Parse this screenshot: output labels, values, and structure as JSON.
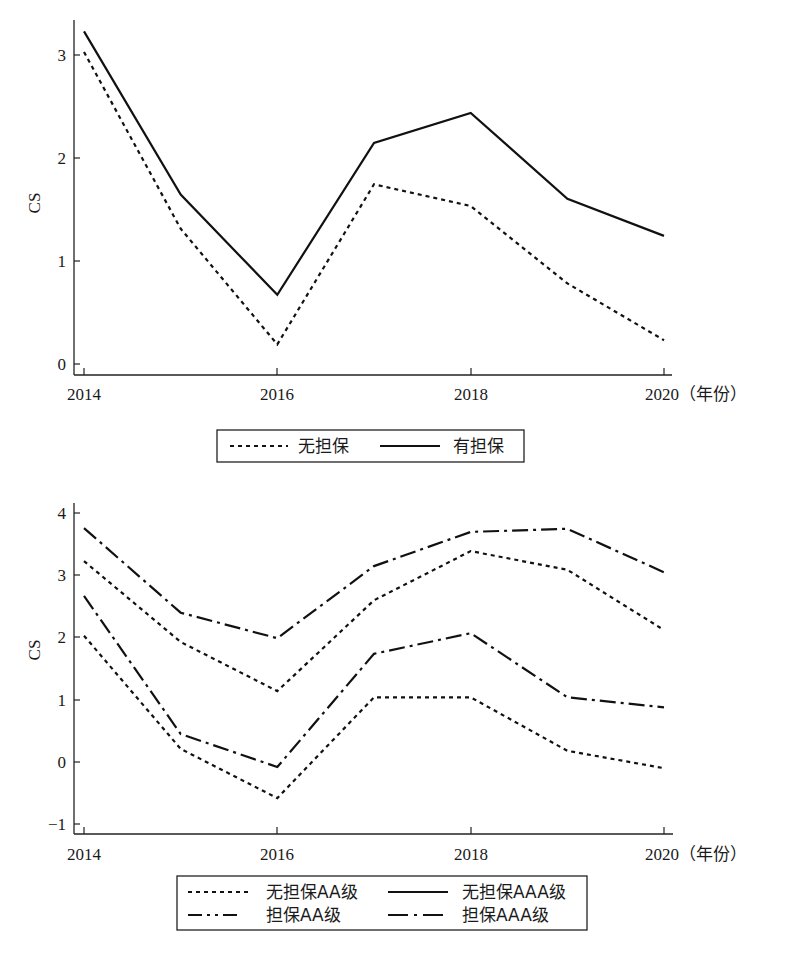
{
  "chart_data": [
    {
      "type": "line",
      "title": "",
      "xlabel": "(年份)",
      "ylabel": "CS",
      "x": [
        2014,
        2015,
        2016,
        2017,
        2018,
        2019,
        2020
      ],
      "x_tick_labels": [
        "2014",
        "2016",
        "2018",
        "2020"
      ],
      "x_last_label_suffix": "（年份）",
      "y_ticks": [
        0,
        1,
        2,
        3
      ],
      "ylim": [
        -0.1,
        3.4
      ],
      "grid": false,
      "legend_position": "bottom-center",
      "series": [
        {
          "name": "无担保",
          "style": "dotted",
          "values": [
            3.02,
            1.31,
            0.19,
            1.74,
            1.53,
            0.78,
            0.23
          ]
        },
        {
          "name": "有担保",
          "style": "solid",
          "values": [
            3.22,
            1.64,
            0.67,
            2.14,
            2.43,
            1.6,
            1.24
          ]
        }
      ]
    },
    {
      "type": "line",
      "title": "",
      "xlabel": "(年份)",
      "ylabel": "CS",
      "x": [
        2014,
        2015,
        2016,
        2017,
        2018,
        2019,
        2020
      ],
      "x_tick_labels": [
        "2014",
        "2016",
        "2018",
        "2020"
      ],
      "x_last_label_suffix": "（年份）",
      "y_ticks": [
        -1,
        0,
        1,
        2,
        3,
        4
      ],
      "ylim": [
        -1.2,
        4.15
      ],
      "grid": false,
      "legend_position": "bottom-center",
      "series": [
        {
          "name": "无担保AA级",
          "style": "dotted",
          "values": [
            2.03,
            0.21,
            -0.58,
            1.04,
            1.04,
            0.18,
            -0.1
          ]
        },
        {
          "name": "无担保AAA级",
          "style": "dotted",
          "values": [
            3.23,
            1.93,
            1.14,
            2.6,
            3.39,
            3.09,
            2.12
          ]
        },
        {
          "name": "担保AA级",
          "style": "dashdot",
          "values": [
            2.67,
            0.45,
            -0.08,
            1.74,
            2.07,
            1.04,
            0.88
          ]
        },
        {
          "name": "担保AAA级",
          "style": "dashdot",
          "values": [
            3.76,
            2.4,
            1.99,
            3.15,
            3.7,
            3.75,
            3.05
          ]
        }
      ]
    }
  ],
  "charts": [
    {
      "ylabel": "CS",
      "x_labels": [
        "2014",
        "2016",
        "2018",
        "2020"
      ],
      "x_suffix": "（年份）",
      "y_labels": [
        "0",
        "1",
        "2",
        "3"
      ],
      "legend": [
        {
          "label": "无担保",
          "style": "dotted"
        },
        {
          "label": "有担保",
          "style": "solid"
        }
      ]
    },
    {
      "ylabel": "CS",
      "x_labels": [
        "2014",
        "2016",
        "2018",
        "2020"
      ],
      "x_suffix": "（年份）",
      "y_labels": [
        "−1",
        "0",
        "1",
        "2",
        "3",
        "4"
      ],
      "legend": [
        {
          "label": "无担保AA级",
          "style": "dotted"
        },
        {
          "label": "无担保AAA级",
          "style": "solid"
        },
        {
          "label": "担保AA级",
          "style": "dashdotdot"
        },
        {
          "label": "担保AAA级",
          "style": "dashdot"
        }
      ]
    }
  ],
  "colors": {
    "line": "#111111",
    "axis": "#222222",
    "background": "#ffffff"
  }
}
